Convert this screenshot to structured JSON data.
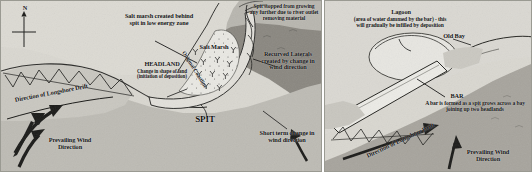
{
  "figure": {
    "type": "coastal-landforms-diagram",
    "panels": [
      {
        "id": "spit",
        "name": "Spit formation diagram",
        "labels": {
          "compass_n": "N",
          "salt_marsh_note": "Salt marsh created behind spit in low energy zone",
          "original_coastline": "Original Coastline",
          "spit_stopped": "Spit stopped from growing any further due to river outlet removing material",
          "salt_marsh": "Salt Marsh",
          "recurved_laterals": "Recurved Laterals created by change in wind direction",
          "headland": "HEADLAND",
          "headland_sub": "Change in shape of land (initiation of deposition)",
          "spit": "SPIT",
          "longshore_drift": "Direction of Longshore Drift",
          "prevailing_wind": "Prevailing Wind Direction",
          "short_term": "Short term change in wind direction"
        }
      },
      {
        "id": "bar",
        "name": "Bar formation diagram",
        "labels": {
          "lagoon": "Lagoon",
          "lagoon_sub": "(area of water dammed by the bar) - this will gradually be infilled by deposition",
          "old_bay": "Old Bay",
          "bar": "BAR",
          "bar_sub": "A bar is formed as a spit grows across a bay joining up two headlands",
          "longshore_drift": "Direction of Longshore Drift",
          "prevailing_wind": "Prevailing Wind Direction"
        }
      }
    ]
  },
  "colors": {
    "paper": "#d8d6cf",
    "sea": "#8e8b85",
    "land": "#cfcdc6",
    "water_light": "#e8e7e2",
    "ink": "#161616",
    "border": "#9a9a92"
  }
}
